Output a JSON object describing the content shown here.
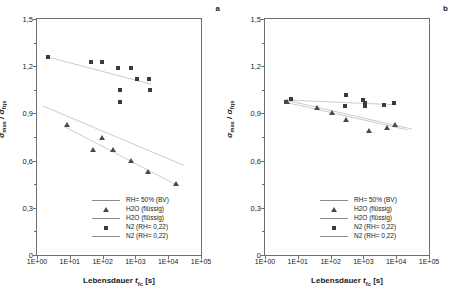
{
  "figure": {
    "panels": [
      {
        "letter": "a",
        "xlabel_pre": "Lebensdauer ",
        "xlabel_var": "t",
        "xlabel_sub": "fc",
        "xlabel_unit": " [s]",
        "ylabel_num": "σ",
        "ylabel_num_sub": "max",
        "ylabel_sep": " / ",
        "ylabel_den": "σ",
        "ylabel_den_sub": "fqs",
        "xticks": [
          "1E+00",
          "1E+01",
          "1E+02",
          "1E+03",
          "1E+04",
          "1E+05"
        ],
        "yticks": [
          "0",
          "0,3",
          "0,6",
          "0,9",
          "1,2",
          "1,5"
        ]
      },
      {
        "letter": "b",
        "xlabel_pre": "Lebensdauer ",
        "xlabel_var": "t",
        "xlabel_sub": "fc",
        "xlabel_unit": " [s]",
        "ylabel_num": "σ",
        "ylabel_num_sub": "max",
        "ylabel_sep": " / ",
        "ylabel_den": "σ",
        "ylabel_den_sub": "fqs",
        "xticks": [
          "1E+00",
          "1E+01",
          "1E+02",
          "1E+03",
          "1E+04",
          "1E+05"
        ],
        "yticks": [
          "0",
          "0,3",
          "0,6",
          "0,9",
          "1,2",
          "1,5"
        ]
      }
    ],
    "legend": [
      {
        "key": "line",
        "label": "RH= 50% (BV)"
      },
      {
        "key": "triangle",
        "label": "H2O (flüssig)"
      },
      {
        "key": "line",
        "label": "H2O (flüssig)"
      },
      {
        "key": "square",
        "label": "N2 (RH= 0,22)"
      },
      {
        "key": "line",
        "label": "N2 (RH= 0,22)"
      }
    ]
  },
  "chart_data": [
    {
      "type": "scatter",
      "panel": "a",
      "title": "",
      "xlabel": "Lebensdauer t_fc [s]",
      "ylabel": "sigma_max / sigma_fqs",
      "xscale": "log",
      "xlim": [
        1,
        100000
      ],
      "ylim": [
        0,
        1.5
      ],
      "grid": false,
      "legend_position": "lower-center-inside",
      "series": [
        {
          "name": "N2 (RH= 0,22)",
          "marker": "square",
          "points": [
            {
              "x": 2.2,
              "y": 1.26
            },
            {
              "x": 45,
              "y": 1.225
            },
            {
              "x": 95,
              "y": 1.225
            },
            {
              "x": 290,
              "y": 1.19
            },
            {
              "x": 750,
              "y": 1.19
            },
            {
              "x": 330,
              "y": 1.05
            },
            {
              "x": 330,
              "y": 0.975
            },
            {
              "x": 1150,
              "y": 1.12
            },
            {
              "x": 2600,
              "y": 1.12
            },
            {
              "x": 2700,
              "y": 1.05
            }
          ]
        },
        {
          "name": "H2O (flüssig)",
          "marker": "triangle",
          "points": [
            {
              "x": 8.5,
              "y": 0.825
            },
            {
              "x": 52,
              "y": 0.67
            },
            {
              "x": 95,
              "y": 0.745
            },
            {
              "x": 210,
              "y": 0.67
            },
            {
              "x": 760,
              "y": 0.595
            },
            {
              "x": 2400,
              "y": 0.525
            },
            {
              "x": 17000,
              "y": 0.45
            }
          ]
        },
        {
          "name": "N2 (RH= 0,22) trend",
          "type": "line",
          "points": [
            {
              "x": 2.2,
              "y": 1.258
            },
            {
              "x": 3000,
              "y": 1.085
            }
          ]
        },
        {
          "name": "RH= 50% (BV) trend",
          "type": "line",
          "points": [
            {
              "x": 1.6,
              "y": 0.945
            },
            {
              "x": 30000,
              "y": 0.57
            }
          ]
        },
        {
          "name": "H2O (flüssig) trend",
          "type": "line",
          "points": [
            {
              "x": 7,
              "y": 0.815
            },
            {
              "x": 20000,
              "y": 0.44
            }
          ]
        }
      ]
    },
    {
      "type": "scatter",
      "panel": "b",
      "title": "",
      "xlabel": "Lebensdauer t_fc [s]",
      "ylabel": "sigma_max / sigma_fqs",
      "xscale": "log",
      "xlim": [
        1,
        100000
      ],
      "ylim": [
        0,
        1.5
      ],
      "grid": false,
      "legend_position": "lower-center-inside",
      "series": [
        {
          "name": "N2 (RH= 0,22)",
          "marker": "square",
          "points": [
            {
              "x": 4.5,
              "y": 0.975
            },
            {
              "x": 6.0,
              "y": 0.99
            },
            {
              "x": 280,
              "y": 0.95
            },
            {
              "x": 300,
              "y": 1.02
            },
            {
              "x": 1000,
              "y": 0.985
            },
            {
              "x": 1100,
              "y": 0.965
            },
            {
              "x": 1150,
              "y": 0.95
            },
            {
              "x": 4200,
              "y": 0.955
            },
            {
              "x": 8500,
              "y": 0.965
            }
          ]
        },
        {
          "name": "H2O (flüssig)",
          "marker": "triangle",
          "points": [
            {
              "x": 4.6,
              "y": 0.975
            },
            {
              "x": 38,
              "y": 0.935
            },
            {
              "x": 110,
              "y": 0.9
            },
            {
              "x": 290,
              "y": 0.855
            },
            {
              "x": 1500,
              "y": 0.785
            },
            {
              "x": 5200,
              "y": 0.805
            },
            {
              "x": 9000,
              "y": 0.825
            }
          ]
        },
        {
          "name": "N2 (RH= 0,22) trend",
          "type": "line",
          "points": [
            {
              "x": 4.2,
              "y": 0.985
            },
            {
              "x": 9500,
              "y": 0.955
            }
          ]
        },
        {
          "name": "RH= 50% (BV) trend",
          "type": "line",
          "points": [
            {
              "x": 4.2,
              "y": 0.985
            },
            {
              "x": 30000,
              "y": 0.8
            }
          ]
        },
        {
          "name": "H2O (flüssig) trend",
          "type": "line",
          "points": [
            {
              "x": 4.4,
              "y": 0.97
            },
            {
              "x": 22000,
              "y": 0.795
            }
          ]
        }
      ]
    }
  ]
}
